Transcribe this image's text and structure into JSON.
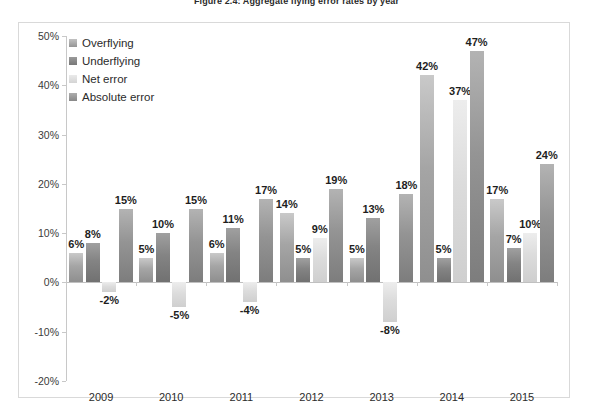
{
  "figure": {
    "title": "Figure 2.4: Aggregate flying error rates by year"
  },
  "legend": {
    "items": [
      {
        "label": "Overflying",
        "color": "#a5a5a5"
      },
      {
        "label": "Underflying",
        "color": "#848484"
      },
      {
        "label": "Net error",
        "color": "#dcdcdc"
      },
      {
        "label": "Absolute error",
        "color": "#949494"
      }
    ]
  },
  "axis": {
    "y_ticks": [
      "50%",
      "40%",
      "30%",
      "20%",
      "10%",
      "0%",
      "-10%",
      "-20%"
    ],
    "y_values": [
      50,
      40,
      30,
      20,
      10,
      0,
      -10,
      -20
    ]
  },
  "chart_data": {
    "type": "bar",
    "title": "Figure 2.4: Aggregate flying error rates by year",
    "xlabel": "",
    "ylabel": "",
    "ylim": [
      -20,
      50
    ],
    "ytick_step": 10,
    "grid": false,
    "legend_position": "top-left-inside",
    "categories": [
      "2009",
      "2010",
      "2011",
      "2012",
      "2013",
      "2014",
      "2015"
    ],
    "series": [
      {
        "name": "Overflying",
        "values": [
          6,
          5,
          6,
          14,
          5,
          42,
          17
        ],
        "labels": [
          "6%",
          "5%",
          "6%",
          "14%",
          "5%",
          "42%",
          "17%"
        ]
      },
      {
        "name": "Underflying",
        "values": [
          8,
          10,
          11,
          5,
          13,
          5,
          7
        ],
        "labels": [
          "8%",
          "10%",
          "11%",
          "5%",
          "13%",
          "5%",
          "7%"
        ]
      },
      {
        "name": "Net error",
        "values": [
          -2,
          -5,
          -4,
          9,
          -8,
          37,
          10
        ],
        "labels": [
          "-2%",
          "-5%",
          "-4%",
          "9%",
          "-8%",
          "37%",
          "10%"
        ]
      },
      {
        "name": "Absolute error",
        "values": [
          15,
          15,
          17,
          19,
          18,
          47,
          24
        ],
        "labels": [
          "15%",
          "15%",
          "17%",
          "19%",
          "18%",
          "47%",
          "24%"
        ]
      }
    ]
  }
}
